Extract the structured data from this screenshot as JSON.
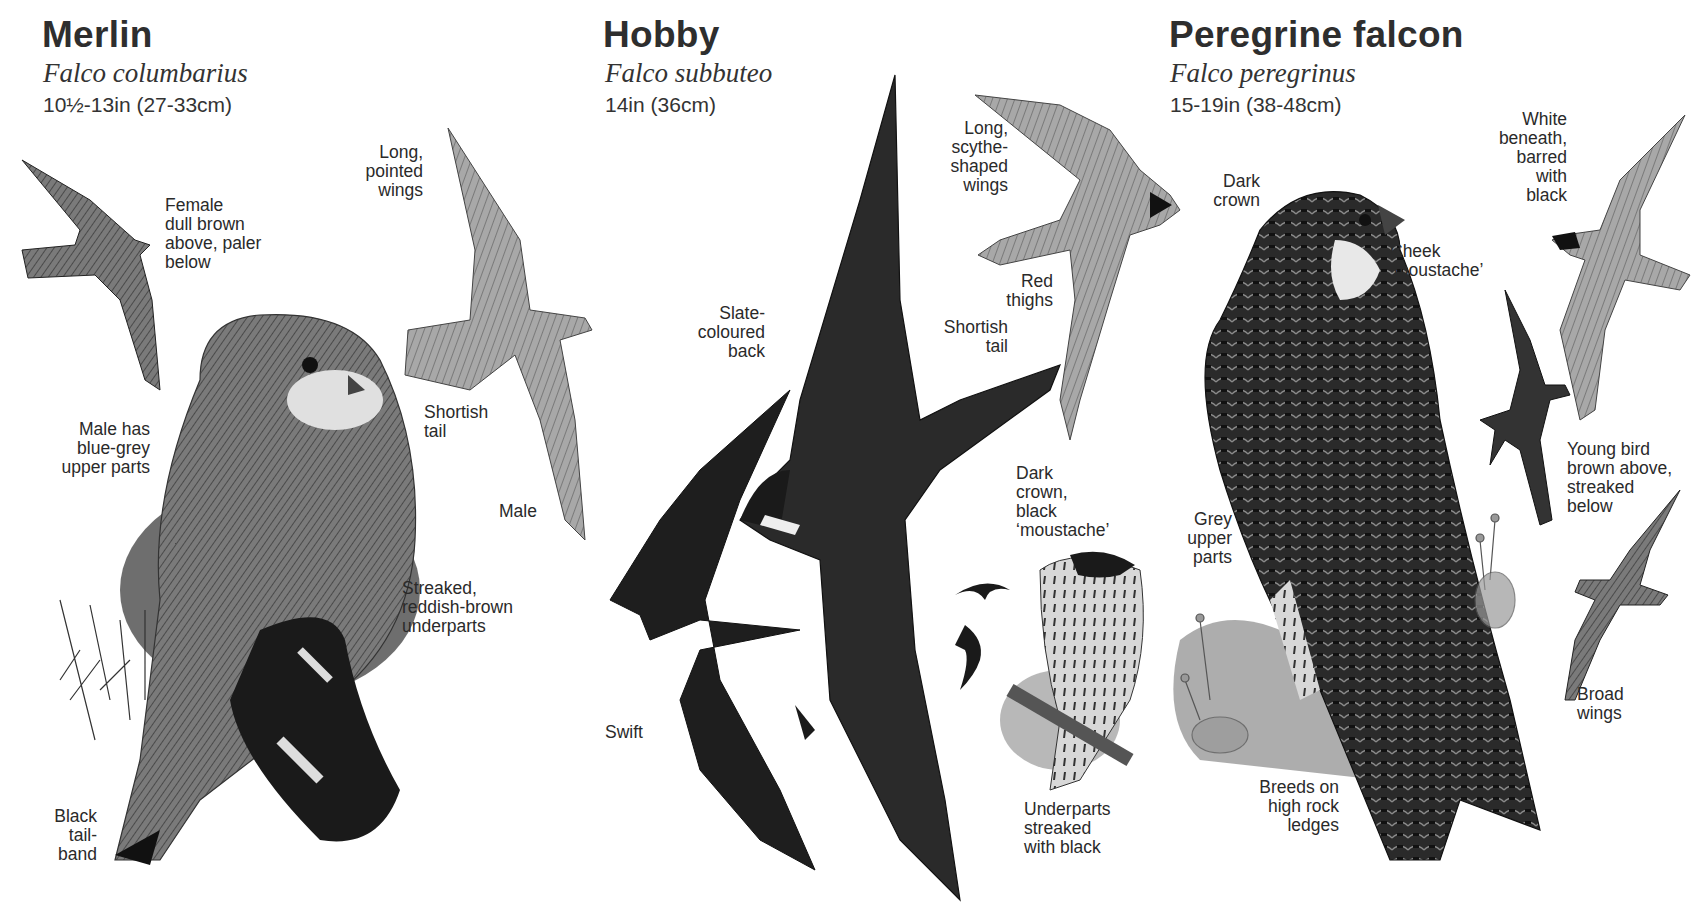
{
  "species": [
    {
      "name": "Merlin",
      "latin": "Falco columbarius",
      "size": "10½-13in (27-33cm)",
      "labels": {
        "female": "Female\ndull brown\nabove, paler\nbelow",
        "wings": "Long,\npointed\nwings",
        "male_upper": "Male has\nblue-grey\nupper parts",
        "shortish_tail": "Shortish\ntail",
        "male": "Male",
        "underparts": "Streaked,\nreddish-brown\nunderparts",
        "tail_band": "Black\ntail-\nband"
      }
    },
    {
      "name": "Hobby",
      "latin": "Falco subbuteo",
      "size": "14in (36cm)",
      "labels": {
        "wings": "Long,\nscythe-\nshaped\nwings",
        "back": "Slate-\ncoloured\nback",
        "red_thighs": "Red\nthighs",
        "shortish_tail": "Shortish\ntail",
        "crown": "Dark\ncrown,\nblack\n‘moustache’",
        "swift": "Swift",
        "underparts": "Underparts\nstreaked\nwith black"
      }
    },
    {
      "name": "Peregrine falcon",
      "latin": "Falco peregrinus",
      "size": "15-19in (38-48cm)",
      "labels": {
        "crown": "Dark\ncrown",
        "white_beneath": "White\nbeneath,\nbarred\nwith\nblack",
        "cheek": "Cheek\n‘moustache’",
        "young": "Young bird\nbrown above,\nstreaked\nbelow",
        "grey_upper": "Grey\nupper\nparts",
        "broad_wings": "Broad\nwings",
        "breeds": "Breeds on\nhigh rock\nledges"
      }
    }
  ],
  "colors": {
    "background": "#ffffff",
    "text": "#2b2b2b",
    "ink_dark": "#1e1e1e",
    "ink_mid": "#5a5a5a",
    "ink_light": "#9a9a9a"
  }
}
